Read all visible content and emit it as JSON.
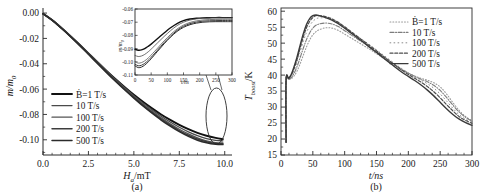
{
  "figure": {
    "background": "#ffffff",
    "ink": "#1a1a1a"
  },
  "panel_a": {
    "caption": "(a)",
    "xlabel": "H",
    "xlabel_sub": "a",
    "xlabel_unit": "/mT",
    "ylabel": "m/m",
    "ylabel_sub": "0",
    "xticks": [
      "0.0",
      "2.5",
      "5.0",
      "7.5",
      "10.0"
    ],
    "yticks": [
      "0.00",
      "-0.02",
      "-0.04",
      "-0.06",
      "-0.08",
      "-0.10"
    ],
    "legend": [
      {
        "label": "Ḃ=1 T/s",
        "style": "solid",
        "color": "#111111",
        "width": 1.9
      },
      {
        "label": "10 T/s",
        "style": "solid",
        "color": "#4a4a4a",
        "width": 1.3
      },
      {
        "label": "100 T/s",
        "style": "solid",
        "color": "#555555",
        "width": 1.3
      },
      {
        "label": "200 T/s",
        "style": "solid",
        "color": "#3d3d3d",
        "width": 1.5
      },
      {
        "label": "500 T/s",
        "style": "solid",
        "color": "#2b2b2b",
        "width": 1.5
      }
    ],
    "annotation": "ellipse-callout"
  },
  "panel_a_inset": {
    "xlabel": "t/ns",
    "ylabel": "m/m",
    "ylabel_sub": "0",
    "xticks": [
      "0",
      "50",
      "100",
      "150",
      "200",
      "250",
      "300"
    ],
    "yticks": [
      "-0.06",
      "-0.07",
      "-0.08",
      "-0.09",
      "-0.10",
      "-0.11"
    ]
  },
  "panel_b": {
    "caption": "(b)",
    "xlabel": "t/ns",
    "ylabel": "T",
    "ylabel_sub": "boost",
    "ylabel_unit": "/K",
    "xticks": [
      "0",
      "50",
      "100",
      "150",
      "200",
      "250",
      "300"
    ],
    "yticks": [
      "15",
      "20",
      "25",
      "30",
      "35",
      "40",
      "45",
      "50",
      "55",
      "60"
    ],
    "legend": [
      {
        "label": "Ḃ=1 T/s",
        "style": "dotted",
        "color": "#9a9a9a",
        "width": 1.1
      },
      {
        "label": "10 T/s",
        "style": "dashdot",
        "color": "#7d7d7d",
        "width": 1.1
      },
      {
        "label": "100 T/s",
        "style": "sparse-dot",
        "color": "#8a8a8a",
        "width": 1.0
      },
      {
        "label": "200 T/s",
        "style": "dashed",
        "color": "#4e4e4e",
        "width": 1.2
      },
      {
        "label": "500 T/s",
        "style": "solid",
        "color": "#3a3a3a",
        "width": 1.4
      }
    ]
  },
  "chart_data": [
    {
      "type": "line",
      "panel": "a",
      "title": "",
      "xlabel": "H_a/mT",
      "ylabel": "m/m_0",
      "xlim": [
        0,
        10.4
      ],
      "ylim": [
        -0.112,
        0.004
      ],
      "xticks": [
        0.0,
        2.5,
        5.0,
        7.5,
        10.0
      ],
      "yticks": [
        0.0,
        -0.02,
        -0.04,
        -0.06,
        -0.08,
        -0.1
      ],
      "grid": false,
      "legend_position": "center-left",
      "x": [
        0,
        0.5,
        1.0,
        1.5,
        2.0,
        2.5,
        3.0,
        3.5,
        4.0,
        4.5,
        5.0,
        5.5,
        6.0,
        6.5,
        7.0,
        7.5,
        8.0,
        8.5,
        9.0,
        9.5,
        9.9
      ],
      "series": [
        {
          "name": "Ḃ=1 T/s",
          "values": [
            -0.0005,
            -0.0055,
            -0.0115,
            -0.018,
            -0.0248,
            -0.0318,
            -0.0388,
            -0.0456,
            -0.0522,
            -0.0585,
            -0.0645,
            -0.07,
            -0.0752,
            -0.08,
            -0.0843,
            -0.0882,
            -0.0916,
            -0.0945,
            -0.0968,
            -0.0985,
            -0.0995
          ]
        },
        {
          "name": "10 T/s",
          "values": [
            -0.0005,
            -0.0055,
            -0.0115,
            -0.018,
            -0.0248,
            -0.0318,
            -0.0388,
            -0.0458,
            -0.0525,
            -0.059,
            -0.0652,
            -0.071,
            -0.0764,
            -0.0814,
            -0.086,
            -0.0901,
            -0.0937,
            -0.0967,
            -0.099,
            -0.1004,
            -0.1008
          ]
        },
        {
          "name": "100 T/s",
          "values": [
            -0.0005,
            -0.0055,
            -0.0115,
            -0.018,
            -0.0248,
            -0.032,
            -0.0392,
            -0.0462,
            -0.053,
            -0.0596,
            -0.0659,
            -0.0719,
            -0.0775,
            -0.0827,
            -0.0874,
            -0.0917,
            -0.0954,
            -0.0985,
            -0.1008,
            -0.1022,
            -0.1025
          ]
        },
        {
          "name": "200 T/s",
          "values": [
            -0.0005,
            -0.0056,
            -0.0117,
            -0.0182,
            -0.0251,
            -0.0323,
            -0.0395,
            -0.0466,
            -0.0535,
            -0.0601,
            -0.0665,
            -0.0726,
            -0.0783,
            -0.0836,
            -0.0884,
            -0.0927,
            -0.0964,
            -0.0994,
            -0.1016,
            -0.1029,
            -0.1032
          ]
        },
        {
          "name": "500 T/s",
          "values": [
            -0.0005,
            -0.0056,
            -0.0118,
            -0.0184,
            -0.0253,
            -0.0325,
            -0.0398,
            -0.047,
            -0.054,
            -0.0607,
            -0.0671,
            -0.0733,
            -0.079,
            -0.0844,
            -0.0892,
            -0.0936,
            -0.0973,
            -0.1003,
            -0.1024,
            -0.1036,
            -0.1038
          ]
        }
      ]
    },
    {
      "type": "line",
      "panel": "a-inset",
      "title": "",
      "xlabel": "t/ns",
      "ylabel": "m/m_0",
      "xlim": [
        0,
        300
      ],
      "ylim": [
        -0.11,
        -0.06
      ],
      "xticks": [
        0,
        50,
        100,
        150,
        200,
        250,
        300
      ],
      "yticks": [
        -0.06,
        -0.07,
        -0.08,
        -0.09,
        -0.1,
        -0.11
      ],
      "grid": false,
      "x": [
        0,
        10,
        20,
        30,
        40,
        50,
        70,
        90,
        110,
        130,
        150,
        170,
        190,
        210,
        230,
        250,
        270,
        290,
        300
      ],
      "series": [
        {
          "name": "Ḃ=1 T/s",
          "values": [
            -0.0905,
            -0.0912,
            -0.091,
            -0.09,
            -0.0884,
            -0.0866,
            -0.0824,
            -0.0782,
            -0.0742,
            -0.071,
            -0.0688,
            -0.0676,
            -0.067,
            -0.0667,
            -0.0666,
            -0.0665,
            -0.0665,
            -0.0665,
            -0.0665
          ]
        },
        {
          "name": "10 T/s",
          "values": [
            -0.0952,
            -0.096,
            -0.0956,
            -0.0944,
            -0.0926,
            -0.0904,
            -0.0856,
            -0.0808,
            -0.0764,
            -0.0726,
            -0.07,
            -0.0684,
            -0.0675,
            -0.067,
            -0.0668,
            -0.0667,
            -0.0667,
            -0.0667,
            -0.0667
          ]
        },
        {
          "name": "100 T/s",
          "values": [
            -0.1,
            -0.101,
            -0.1006,
            -0.0993,
            -0.0973,
            -0.0949,
            -0.0896,
            -0.0842,
            -0.0793,
            -0.0752,
            -0.0722,
            -0.0702,
            -0.069,
            -0.0683,
            -0.068,
            -0.0679,
            -0.0678,
            -0.0678,
            -0.0678
          ]
        },
        {
          "name": "200 T/s",
          "values": [
            -0.1018,
            -0.103,
            -0.1026,
            -0.1012,
            -0.0991,
            -0.0966,
            -0.0911,
            -0.0855,
            -0.0805,
            -0.0762,
            -0.0731,
            -0.0711,
            -0.0699,
            -0.0692,
            -0.0689,
            -0.0688,
            -0.0687,
            -0.0687,
            -0.0687
          ]
        },
        {
          "name": "500 T/s",
          "values": [
            -0.103,
            -0.1044,
            -0.104,
            -0.1025,
            -0.1003,
            -0.0977,
            -0.092,
            -0.0864,
            -0.0813,
            -0.077,
            -0.0739,
            -0.0719,
            -0.0707,
            -0.07,
            -0.0697,
            -0.0696,
            -0.0696,
            -0.0696,
            -0.0696
          ]
        }
      ]
    },
    {
      "type": "line",
      "panel": "b",
      "title": "",
      "xlabel": "t/ns",
      "ylabel": "T_boost/K",
      "xlim": [
        0,
        300
      ],
      "ylim": [
        15,
        61
      ],
      "xticks": [
        0,
        50,
        100,
        150,
        200,
        250,
        300
      ],
      "yticks": [
        15,
        20,
        25,
        30,
        35,
        40,
        45,
        50,
        55,
        60
      ],
      "grid": false,
      "legend_position": "upper-right",
      "x": [
        8,
        8,
        12,
        16,
        20,
        25,
        30,
        35,
        40,
        45,
        50,
        55,
        60,
        70,
        80,
        90,
        100,
        110,
        120,
        130,
        140,
        150,
        160,
        170,
        180,
        190,
        200,
        210,
        220,
        230,
        240,
        250,
        260,
        270,
        280,
        290,
        300
      ],
      "series": [
        {
          "name": "Ḃ=1 T/s",
          "values": [
            19.0,
            38.5,
            38.6,
            38.9,
            39.6,
            41.2,
            43.5,
            46.2,
            48.8,
            51.0,
            52.6,
            53.6,
            54.2,
            54.8,
            54.7,
            54.0,
            52.8,
            51.6,
            50.4,
            49.2,
            48.0,
            46.7,
            45.4,
            44.1,
            42.8,
            41.6,
            40.6,
            39.7,
            39.0,
            38.4,
            37.6,
            36.3,
            34.1,
            31.4,
            28.9,
            27.0,
            25.8
          ]
        },
        {
          "name": "10 T/s",
          "values": [
            19.0,
            38.5,
            38.7,
            39.2,
            40.4,
            42.6,
            45.4,
            48.4,
            51.1,
            53.2,
            54.7,
            55.6,
            56.0,
            56.3,
            56.0,
            55.2,
            53.9,
            52.6,
            51.3,
            50.0,
            48.7,
            47.3,
            45.9,
            44.5,
            43.1,
            41.8,
            40.6,
            39.6,
            38.7,
            37.9,
            36.8,
            35.2,
            33.0,
            30.6,
            28.4,
            26.8,
            25.6
          ]
        },
        {
          "name": "100 T/s",
          "values": [
            19.0,
            38.5,
            38.8,
            39.6,
            41.2,
            43.9,
            47.2,
            50.5,
            53.3,
            55.4,
            56.8,
            57.6,
            57.9,
            57.9,
            57.4,
            56.4,
            55.0,
            53.6,
            52.2,
            50.8,
            49.4,
            47.9,
            46.4,
            44.9,
            43.4,
            42.0,
            40.7,
            39.5,
            38.4,
            37.3,
            35.9,
            34.1,
            31.9,
            29.6,
            27.6,
            26.2,
            25.2
          ]
        },
        {
          "name": "200 T/s",
          "values": [
            19.0,
            38.5,
            38.9,
            39.9,
            41.8,
            44.8,
            48.4,
            51.9,
            54.8,
            56.8,
            58.0,
            58.6,
            58.6,
            58.3,
            57.6,
            56.5,
            55.1,
            53.6,
            52.1,
            50.6,
            49.1,
            47.6,
            46.0,
            44.5,
            43.0,
            41.5,
            40.2,
            39.0,
            37.8,
            36.4,
            34.8,
            32.9,
            30.8,
            28.8,
            27.0,
            25.8,
            24.9
          ]
        },
        {
          "name": "500 T/s",
          "values": [
            19.0,
            38.5,
            39.0,
            40.2,
            42.3,
            45.5,
            49.3,
            52.9,
            55.8,
            57.7,
            58.6,
            58.8,
            58.6,
            58.0,
            57.2,
            56.1,
            54.7,
            53.2,
            51.7,
            50.2,
            48.6,
            47.1,
            45.5,
            44.0,
            42.4,
            40.9,
            39.6,
            38.3,
            36.9,
            35.3,
            33.5,
            31.5,
            29.5,
            27.7,
            26.2,
            25.1,
            24.3
          ]
        }
      ]
    }
  ]
}
